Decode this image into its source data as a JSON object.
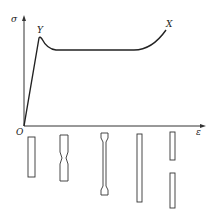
{
  "diagram": {
    "axes": {
      "y_label": "σ",
      "x_label": "ε",
      "origin_label": "O"
    },
    "points": {
      "yield_label": "Y",
      "fracture_label": "X"
    },
    "curve": {
      "description": "Linear elastic rise from O to yield point Y, drop to plateau, long plateau (necking propagation), then strain hardening up to X",
      "path_points": [
        [
          24,
          126
        ],
        [
          40,
          37
        ],
        [
          53,
          50
        ],
        [
          135,
          50
        ],
        [
          166,
          29
        ]
      ]
    },
    "specimens": [
      {
        "id": 1,
        "state": "original uniform bar"
      },
      {
        "id": 2,
        "state": "neck forming at center"
      },
      {
        "id": 3,
        "state": "neck propagated along gauge length (dog-bone)"
      },
      {
        "id": 4,
        "state": "uniformly drawn, elongated"
      },
      {
        "id": 5,
        "state": "fractured into two pieces"
      }
    ],
    "colors": {
      "line": "#222222",
      "background": "#ffffff"
    }
  }
}
